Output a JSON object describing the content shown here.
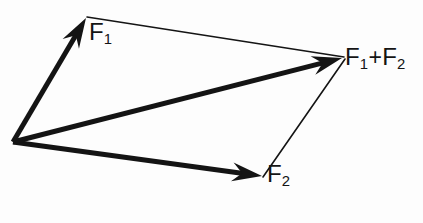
{
  "figure": {
    "type": "vector-diagram",
    "width": 423,
    "height": 223,
    "background_color": "#fdfdfd",
    "stroke_color": "#141414",
    "text_color": "#141414"
  },
  "labels": {
    "f1": {
      "base": "F",
      "sub": "1"
    },
    "f2": {
      "base": "F",
      "sub": "2"
    },
    "sum": {
      "base1": "F",
      "sub1": "1",
      "operator": "+",
      "base2": "F",
      "sub2": "2"
    }
  },
  "chart_data": {
    "type": "scatter",
    "xlabel": "",
    "ylabel": "",
    "xlim": [
      0,
      423
    ],
    "ylim": [
      0,
      223
    ],
    "grid": false,
    "legend": "none",
    "origin": {
      "x": 13,
      "y": 142
    },
    "vectors": [
      {
        "name": "F1",
        "label": "F₁",
        "style": "thick-arrow",
        "stroke_width": 5,
        "from": {
          "x": 13,
          "y": 142
        },
        "to": {
          "x": 86,
          "y": 18
        },
        "components": {
          "dx": 73,
          "dy": -124
        },
        "label_position": {
          "x": 89,
          "y": 20
        }
      },
      {
        "name": "F2",
        "label": "F₂",
        "style": "thick-arrow",
        "stroke_width": 5,
        "from": {
          "x": 13,
          "y": 142
        },
        "to": {
          "x": 262,
          "y": 176
        },
        "components": {
          "dx": 249,
          "dy": 34
        },
        "label_position": {
          "x": 267,
          "y": 162
        }
      },
      {
        "name": "F1+F2",
        "label": "F₁+F₂",
        "style": "thick-arrow",
        "stroke_width": 5,
        "from": {
          "x": 13,
          "y": 142
        },
        "to": {
          "x": 342,
          "y": 58
        },
        "components": {
          "dx": 329,
          "dy": -84
        },
        "label_position": {
          "x": 345,
          "y": 45
        }
      }
    ],
    "construction_lines": [
      {
        "name": "f1-to-resultant",
        "style": "thin-line",
        "stroke_width": 1.6,
        "from": {
          "x": 87,
          "y": 17
        },
        "to": {
          "x": 344,
          "y": 57
        }
      },
      {
        "name": "f2-to-resultant",
        "style": "thin-line",
        "stroke_width": 1.6,
        "from": {
          "x": 263,
          "y": 177
        },
        "to": {
          "x": 345,
          "y": 59
        }
      }
    ],
    "annotations": [
      {
        "text": "F₁",
        "x": 89,
        "y": 20
      },
      {
        "text": "F₂",
        "x": 267,
        "y": 162
      },
      {
        "text": "F₁+F₂",
        "x": 345,
        "y": 45
      }
    ]
  }
}
